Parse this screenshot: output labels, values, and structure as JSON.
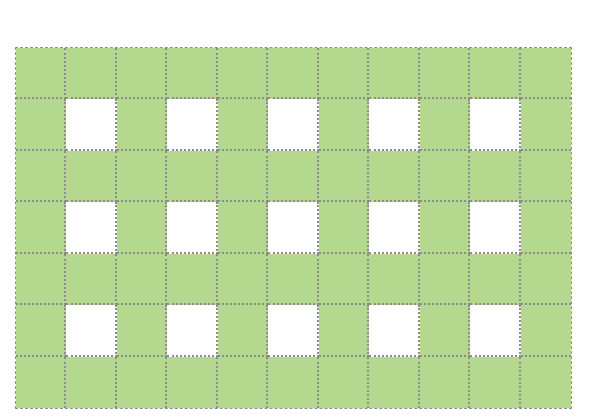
{
  "diagram": {
    "type": "grid-pattern",
    "columns": 11,
    "rows": 7,
    "colors": {
      "filled": "#b5d88f",
      "empty": "#ffffff",
      "line": "#8c8c8c"
    },
    "white_cells": [
      [
        1,
        1
      ],
      [
        1,
        3
      ],
      [
        1,
        5
      ],
      [
        1,
        7
      ],
      [
        1,
        9
      ],
      [
        3,
        1
      ],
      [
        3,
        3
      ],
      [
        3,
        5
      ],
      [
        3,
        7
      ],
      [
        3,
        9
      ],
      [
        5,
        1
      ],
      [
        5,
        3
      ],
      [
        5,
        5
      ],
      [
        5,
        7
      ],
      [
        5,
        9
      ]
    ],
    "counts": {
      "total_cells": 77,
      "white_cells": 15,
      "green_cells": 62
    }
  }
}
